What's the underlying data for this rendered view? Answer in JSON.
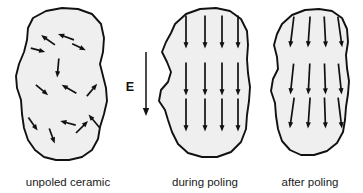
{
  "figure": {
    "background_color": "#ffffff",
    "grain_fill_color": "#efefef",
    "outline_color": "#111111",
    "arrow_color": "#111111"
  },
  "panels": [
    {
      "id": "unpoled",
      "caption": "unpoled ceramic",
      "caption_x": 68,
      "caption_y": 186,
      "outline": "M 33 18 L 46 11 L 62 8 L 78 9 L 92 14 L 101 24 L 104 38 L 103 52 L 100 64 L 103 76 L 106 88 L 107 101 L 104 114 L 100 127 L 98 139 L 92 150 L 82 157 L 69 160 L 56 160 L 44 157 L 35 150 L 28 140 L 24 128 L 22 114 L 21 100 L 17 88 L 16 76 L 19 64 L 24 52 L 27 40 L 28 28 Z",
      "arrow_count": 13,
      "arrows": [
        {
          "x": 48,
          "y": 40,
          "angle": -55,
          "length": 17
        },
        {
          "x": 66,
          "y": 37,
          "angle": -70,
          "length": 17
        },
        {
          "x": 38,
          "y": 50,
          "angle": 105,
          "length": 15
        },
        {
          "x": 79,
          "y": 47,
          "angle": 115,
          "length": 15
        },
        {
          "x": 58,
          "y": 68,
          "angle": 185,
          "length": 19
        },
        {
          "x": 42,
          "y": 90,
          "angle": 130,
          "length": 16
        },
        {
          "x": 69,
          "y": 89,
          "angle": -60,
          "length": 17
        },
        {
          "x": 92,
          "y": 90,
          "angle": 40,
          "length": 16
        },
        {
          "x": 33,
          "y": 124,
          "angle": 145,
          "length": 16
        },
        {
          "x": 52,
          "y": 136,
          "angle": 160,
          "length": 16
        },
        {
          "x": 68,
          "y": 123,
          "angle": -75,
          "length": 16
        },
        {
          "x": 82,
          "y": 127,
          "angle": 45,
          "length": 17
        },
        {
          "x": 94,
          "y": 121,
          "angle": -40,
          "length": 17
        }
      ]
    },
    {
      "id": "during",
      "caption": "during poling",
      "caption_x": 205,
      "caption_y": 186,
      "outline": "M 175 24 L 186 14 L 200 9 L 216 8 L 230 11 L 241 19 L 247 31 L 248 45 L 247 59 L 248 73 L 250 87 L 249 101 L 247 115 L 246 129 L 241 142 L 231 152 L 217 157 L 202 157 L 188 153 L 178 144 L 172 132 L 168 120 L 165 110 L 159 101 L 161 90 L 168 82 L 171 72 L 167 62 L 162 52 L 166 42 L 171 33 Z",
      "rows": 3,
      "cols": 4,
      "arrow_angle": 180,
      "arrow_count": 12,
      "arrows": [
        {
          "x": 186,
          "y": 32,
          "angle": 180,
          "length": 33
        },
        {
          "x": 205,
          "y": 32,
          "angle": 180,
          "length": 33
        },
        {
          "x": 222,
          "y": 32,
          "angle": 180,
          "length": 33
        },
        {
          "x": 238,
          "y": 32,
          "angle": 180,
          "length": 33
        },
        {
          "x": 186,
          "y": 79,
          "angle": 180,
          "length": 33
        },
        {
          "x": 205,
          "y": 79,
          "angle": 180,
          "length": 33
        },
        {
          "x": 222,
          "y": 79,
          "angle": 180,
          "length": 33
        },
        {
          "x": 238,
          "y": 79,
          "angle": 180,
          "length": 33
        },
        {
          "x": 186,
          "y": 115,
          "angle": 180,
          "length": 33
        },
        {
          "x": 205,
          "y": 115,
          "angle": 180,
          "length": 33
        },
        {
          "x": 222,
          "y": 115,
          "angle": 180,
          "length": 33
        },
        {
          "x": 238,
          "y": 115,
          "angle": 180,
          "length": 33
        }
      ]
    },
    {
      "id": "after",
      "caption": "after poling",
      "caption_x": 310,
      "caption_y": 186,
      "outline": "M 282 24 L 292 15 L 305 10 L 319 9 L 332 11 L 342 18 L 347 29 L 348 42 L 346 55 L 347 68 L 349 81 L 348 94 L 346 107 L 345 120 L 343 132 L 337 143 L 327 151 L 314 155 L 301 155 L 290 150 L 282 141 L 278 129 L 276 116 L 275 103 L 271 91 L 273 79 L 278 69 L 277 57 L 274 45 L 277 34 Z",
      "rows": 3,
      "cols": 4,
      "arrow_count": 12,
      "arrows": [
        {
          "x": 292,
          "y": 32,
          "angle": 187,
          "length": 31
        },
        {
          "x": 309,
          "y": 32,
          "angle": 184,
          "length": 31
        },
        {
          "x": 325,
          "y": 32,
          "angle": 177,
          "length": 31
        },
        {
          "x": 340,
          "y": 32,
          "angle": 172,
          "length": 31
        },
        {
          "x": 292,
          "y": 79,
          "angle": 186,
          "length": 31
        },
        {
          "x": 309,
          "y": 79,
          "angle": 183,
          "length": 31
        },
        {
          "x": 325,
          "y": 79,
          "angle": 178,
          "length": 31
        },
        {
          "x": 340,
          "y": 79,
          "angle": 174,
          "length": 31
        },
        {
          "x": 292,
          "y": 113,
          "angle": 188,
          "length": 31
        },
        {
          "x": 309,
          "y": 113,
          "angle": 184,
          "length": 31
        },
        {
          "x": 325,
          "y": 113,
          "angle": 178,
          "length": 31
        },
        {
          "x": 340,
          "y": 113,
          "angle": 173,
          "length": 31
        }
      ]
    }
  ],
  "field": {
    "label": "E",
    "label_x": 130,
    "label_y": 91,
    "arrow_x": 146,
    "arrow_top": 52,
    "arrow_bottom": 116,
    "direction": "down"
  }
}
